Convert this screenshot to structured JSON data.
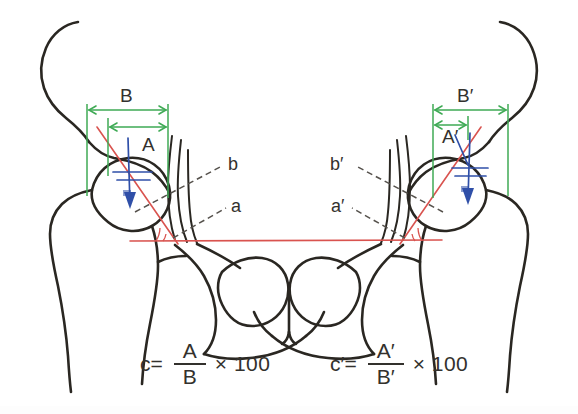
{
  "figure": {
    "background_color": "#ffffff",
    "width": 578,
    "height": 414
  },
  "colors": {
    "bone_outline": "#2a2722",
    "measurement_green": "#3faa55",
    "reference_red": "#d9534f",
    "vertical_blue": "#2f4fa8",
    "dashed_gray": "#55514c",
    "text": "#33312d"
  },
  "left_hip": {
    "dimension_a_label": "A",
    "dimension_b_label": "B",
    "axis_a_label": "a",
    "axis_b_label": "b"
  },
  "right_hip": {
    "dimension_a_label": "A′",
    "dimension_b_label": "B′",
    "axis_a_label": "a′",
    "axis_b_label": "b′"
  },
  "formula_left": {
    "lead": "c=",
    "numerator": "A",
    "denominator": "B",
    "tail": "× 100"
  },
  "formula_right": {
    "lead": "c′=",
    "numerator": "A′",
    "denominator": "B′",
    "tail": "× 100"
  }
}
